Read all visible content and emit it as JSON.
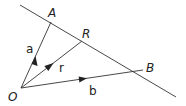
{
  "diagram": {
    "points": {
      "O": {
        "label": "O",
        "x": 21,
        "y": 88
      },
      "A": {
        "label": "A",
        "x": 51,
        "y": 22
      },
      "R": {
        "label": "R",
        "x": 82,
        "y": 41
      },
      "B": {
        "label": "B",
        "x": 143,
        "y": 70
      }
    },
    "vectors": {
      "a": {
        "label": "a",
        "from": "O",
        "to": "A"
      },
      "r": {
        "label": "r",
        "from": "O",
        "to": "R"
      },
      "b": {
        "label": "b",
        "from": "O",
        "to": "B"
      }
    },
    "line": {
      "description": "Line through A, R, B"
    },
    "colors": {
      "stroke": "#333333",
      "text": "#222222"
    }
  }
}
